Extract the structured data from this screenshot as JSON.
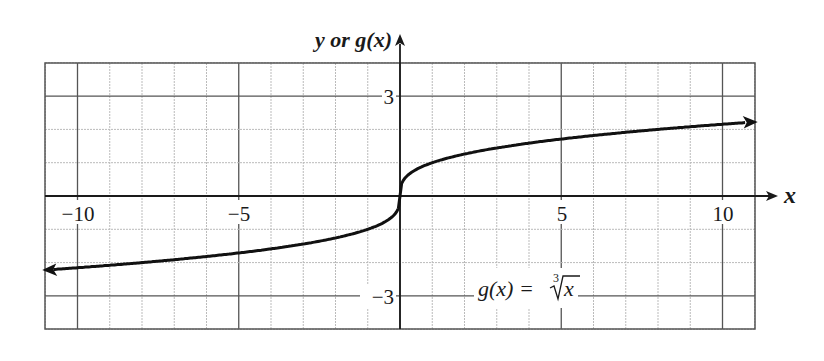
{
  "chart_data": {
    "type": "line",
    "title": "",
    "xlabel": "x",
    "ylabel": "y or g(x)",
    "xlim": [
      -11,
      11
    ],
    "ylim": [
      -4,
      4
    ],
    "x_ticks": [
      -10,
      -5,
      5,
      10
    ],
    "x_tick_labels": [
      "−10",
      "−5",
      "5",
      "10"
    ],
    "y_ticks": [
      3,
      -3
    ],
    "y_tick_labels": [
      "3",
      "−3"
    ],
    "grid": true,
    "legend": null,
    "annotations": [
      {
        "text": "g(x) = ∛x",
        "x": 3.2,
        "y": -2.8
      }
    ],
    "series": [
      {
        "name": "g(x) = cube root of x",
        "x": [
          -11,
          -10,
          -8,
          -6,
          -5,
          -4,
          -3,
          -2,
          -1,
          -0.5,
          -0.1,
          0,
          0.1,
          0.5,
          1,
          2,
          3,
          4,
          5,
          6,
          8,
          10,
          11
        ],
        "y": [
          -2.22,
          -2.15,
          -2.0,
          -1.82,
          -1.71,
          -1.59,
          -1.44,
          -1.26,
          -1.0,
          -0.79,
          -0.46,
          0,
          0.46,
          0.79,
          1.0,
          1.26,
          1.44,
          1.59,
          1.71,
          1.82,
          2.0,
          2.15,
          2.22
        ],
        "arrows": "both"
      }
    ]
  },
  "labels": {
    "y_axis": "y or g(x)",
    "x_axis": "x",
    "tick_m10": "−10",
    "tick_m5": "−5",
    "tick_5": "5",
    "tick_10": "10",
    "tick_3": "3",
    "tick_m3": "−3",
    "func_lhs": "g(x) =",
    "func_index": "3",
    "func_arg": "x"
  },
  "colors": {
    "curve": "#111111",
    "axis": "#1a1a1a",
    "major_grid": "#555555",
    "minor_grid": "#bbbbbb"
  }
}
